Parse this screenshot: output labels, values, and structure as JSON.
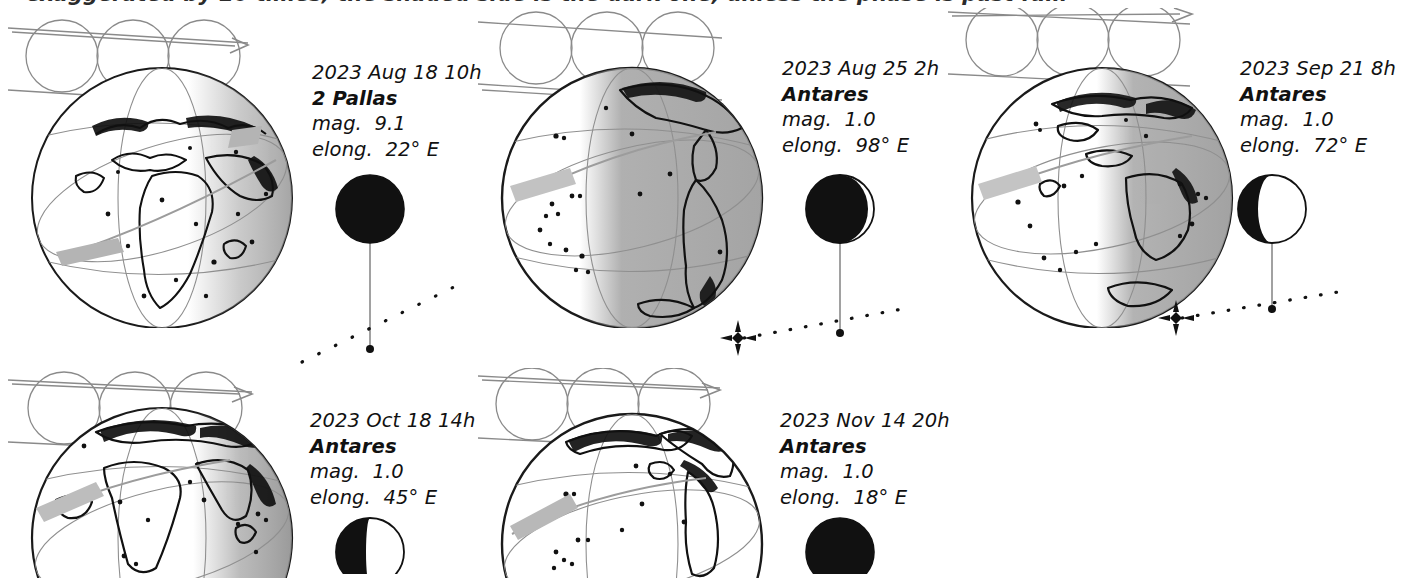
{
  "figure": {
    "top_cut_text": "exaggerated by 20 times; the shaded side is the dark one, unless the phase is past full."
  },
  "panels": [
    {
      "id": "panel-1",
      "datetime": "2023 Aug 18 10h",
      "object": "2 Pallas",
      "mag_label": "mag.",
      "mag_value": "9.1",
      "elong_label": "elong.",
      "elong_value": "22° E",
      "moon": {
        "phase_name": "new",
        "lit_fraction": 0.02,
        "lit_side": "right",
        "radius": 34
      },
      "globe": {
        "view": "africa-europe",
        "night_fraction": 0.0,
        "night_side": "right",
        "track_label": "occultation-track"
      },
      "star": {
        "visible": false,
        "path_slope": "steep-up-right"
      }
    },
    {
      "id": "panel-2",
      "datetime": "2023 Aug 25 2h",
      "object": "Antares",
      "mag_label": "mag.",
      "mag_value": "1.0",
      "elong_label": "elong.",
      "elong_value": "98° E",
      "moon": {
        "phase_name": "first-quarter",
        "lit_fraction": 0.55,
        "lit_side": "right",
        "radius": 34
      },
      "globe": {
        "view": "pacific-americas",
        "night_fraction": 0.55,
        "night_side": "right",
        "track_label": "occultation-track"
      },
      "star": {
        "visible": true,
        "path_slope": "shallow-up-right"
      }
    },
    {
      "id": "panel-3",
      "datetime": "2023 Sep 21 8h",
      "object": "Antares",
      "mag_label": "mag.",
      "mag_value": "1.0",
      "elong_label": "elong.",
      "elong_value": "72° E",
      "moon": {
        "phase_name": "waxing-crescent",
        "lit_fraction": 0.32,
        "lit_side": "right",
        "radius": 34
      },
      "globe": {
        "view": "asia-australia",
        "night_fraction": 0.42,
        "night_side": "right",
        "track_label": "occultation-track"
      },
      "star": {
        "visible": true,
        "path_slope": "shallow-up-right"
      }
    },
    {
      "id": "panel-4",
      "datetime": "2023 Oct 18 14h",
      "object": "Antares",
      "mag_label": "mag.",
      "mag_value": "1.0",
      "elong_label": "elong.",
      "elong_value": "45° E",
      "moon": {
        "phase_name": "waxing-crescent",
        "lit_fraction": 0.12,
        "lit_side": "right",
        "radius": 34
      },
      "globe": {
        "view": "africa-atlantic",
        "night_fraction": 0.22,
        "night_side": "right",
        "track_label": "occultation-track"
      },
      "star": {
        "visible": false,
        "path_slope": "none"
      }
    },
    {
      "id": "panel-5",
      "datetime": "2023 Nov 14 20h",
      "object": "Antares",
      "mag_label": "mag.",
      "mag_value": "1.0",
      "elong_label": "elong.",
      "elong_value": "18° E",
      "moon": {
        "phase_name": "new",
        "lit_fraction": 0.02,
        "lit_side": "right",
        "radius": 34
      },
      "globe": {
        "view": "americas-atlantic",
        "night_fraction": 0.0,
        "night_side": "right",
        "track_label": "occultation-track"
      },
      "star": {
        "visible": false,
        "path_slope": "none"
      }
    }
  ],
  "colors": {
    "ink": "#000000",
    "line_gray": "#7b7b7b",
    "night_gray": "#9e9e9e",
    "track_gray": "#b0b0b0",
    "paper": "#ffffff"
  }
}
